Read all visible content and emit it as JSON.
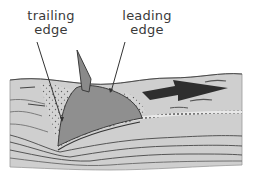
{
  "labels": {
    "trailing": {
      "line1": "trailing",
      "line2": "edge"
    },
    "leading": {
      "line1": "leading",
      "line2": "edge"
    }
  },
  "colors": {
    "sediment": "#cfcfcf",
    "sediment_dark": "#bdbdbd",
    "body": "#8f8f8f",
    "fin": "#8a8a8a",
    "arrow": "#2e2e2e",
    "outline": "#3c3c3c",
    "text": "#3a3a3a"
  },
  "arrow": {
    "direction": "right",
    "label": "movement direction"
  }
}
